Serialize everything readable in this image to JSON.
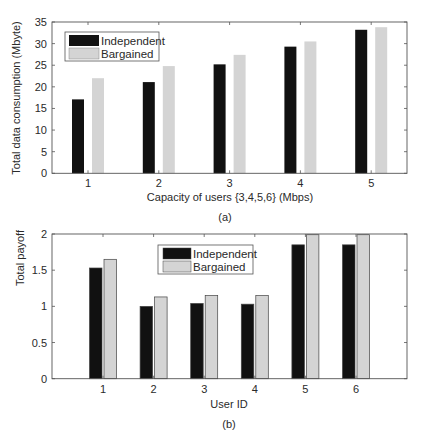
{
  "colors": {
    "independent": "#111111",
    "bargained": "#d4d4d4",
    "axis": "#555555",
    "bar_outline_b": "#444444"
  },
  "chart_data": [
    {
      "id": "a",
      "type": "bar",
      "panel_label": "(a)",
      "title": "",
      "xlabel": "Capacity of users {3,4,5,6} (Mbps)",
      "ylabel": "Total data consumption (Mbyte)",
      "categories": [
        "1",
        "2",
        "3",
        "4",
        "5"
      ],
      "ylim": [
        0,
        35
      ],
      "yticks": [
        0,
        5,
        10,
        15,
        20,
        25,
        30,
        35
      ],
      "ytick_labels": [
        "0",
        "5",
        "10",
        "15",
        "20",
        "25",
        "30",
        "35"
      ],
      "grid": false,
      "legend_position": "top-left",
      "series": [
        {
          "name": "Independent",
          "values": [
            17.1,
            21.1,
            25.2,
            29.3,
            33.2
          ]
        },
        {
          "name": "Bargained",
          "values": [
            22.0,
            24.8,
            27.4,
            30.5,
            33.8
          ]
        }
      ]
    },
    {
      "id": "b",
      "type": "bar",
      "panel_label": "(b)",
      "title": "",
      "xlabel": "User ID",
      "ylabel": "Total payoff",
      "categories": [
        "1",
        "2",
        "3",
        "4",
        "5",
        "6"
      ],
      "ylim": [
        0,
        2
      ],
      "yticks": [
        0,
        0.5,
        1,
        1.5,
        2
      ],
      "ytick_labels": [
        "0",
        "0.5",
        "1",
        "1.5",
        "2"
      ],
      "grid": false,
      "legend_position": "top-center",
      "series": [
        {
          "name": "Independent",
          "values": [
            1.53,
            1.0,
            1.04,
            1.03,
            1.85,
            1.85
          ]
        },
        {
          "name": "Bargained",
          "values": [
            1.65,
            1.13,
            1.15,
            1.15,
            1.99,
            1.99
          ]
        }
      ]
    }
  ]
}
